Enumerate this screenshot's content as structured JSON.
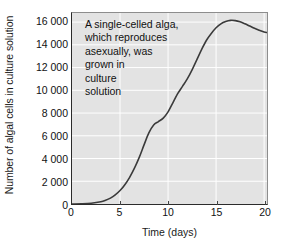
{
  "chart_data": {
    "type": "line",
    "title": "",
    "xlabel": "Time (days)",
    "ylabel": "Number of algal cells in culture solution",
    "xlim": [
      0,
      20.3
    ],
    "ylim": [
      0,
      16800
    ],
    "xticks": [
      0,
      5,
      10,
      15,
      20
    ],
    "xtick_labels": [
      "0",
      "5",
      "10",
      "15",
      "20"
    ],
    "yticks": [
      0,
      2000,
      4000,
      6000,
      8000,
      10000,
      12000,
      14000,
      16000
    ],
    "ytick_labels": [
      "0",
      "2 000",
      "4 000",
      "6 000",
      "8 000",
      "10 000",
      "12 000",
      "14 000",
      "16 000"
    ],
    "grid": true,
    "grid_color": "#ffffff",
    "plot_background": "#e3e3e3",
    "line_color": "#3a3a3a",
    "line_width": 1.6,
    "legend": "none",
    "annotations": [
      {
        "name": "description",
        "lines": [
          "A single-celled alga,",
          "which reproduces",
          "asexually, was",
          "grown in",
          "culture",
          "solution"
        ]
      }
    ],
    "series": [
      {
        "name": "Algal cell count",
        "x": [
          0,
          1,
          2,
          3,
          3.5,
          4,
          4.5,
          5,
          5.5,
          6,
          6.5,
          7,
          7.5,
          8,
          8.5,
          9,
          9.5,
          10,
          10.5,
          11,
          11.5,
          12,
          12.5,
          13,
          13.5,
          14,
          14.5,
          15,
          15.5,
          16,
          16.5,
          17,
          17.5,
          18,
          18.5,
          19,
          19.5,
          20,
          20.3
        ],
        "y": [
          0,
          20,
          70,
          200,
          330,
          520,
          800,
          1180,
          1700,
          2350,
          3150,
          4100,
          5200,
          6250,
          6950,
          7250,
          7550,
          8100,
          8900,
          9700,
          10350,
          11000,
          11800,
          12700,
          13600,
          14400,
          15000,
          15500,
          15850,
          16050,
          16150,
          16130,
          16020,
          15850,
          15650,
          15450,
          15280,
          15120,
          15080
        ]
      }
    ]
  }
}
